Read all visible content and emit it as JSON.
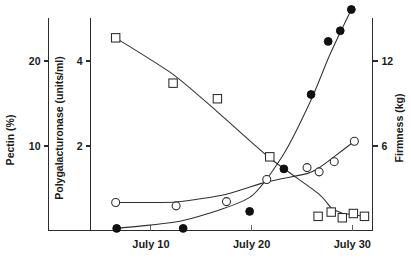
{
  "chart_data": {
    "type": "line",
    "title": "",
    "subtitle": "",
    "xlabel": "",
    "grid": false,
    "legend_position": "none",
    "x_axis": {
      "label": "",
      "tick_labels": [
        "July 10",
        "July 20",
        "July 30"
      ],
      "tick_values": [
        10,
        20,
        30
      ],
      "range": [
        4,
        32
      ]
    },
    "y_axes": [
      {
        "id": "pectin",
        "label": "Pectin (%)",
        "position": "left-outer",
        "tick_labels": [
          "10",
          "20"
        ],
        "tick_values": [
          10,
          20
        ],
        "range": [
          0,
          25
        ]
      },
      {
        "id": "polygalacturonase",
        "label": "Polygalacturonase  (units/ml)",
        "position": "left-inner",
        "tick_labels": [
          "2",
          "4"
        ],
        "tick_values": [
          2,
          4
        ],
        "range": [
          0,
          5
        ]
      },
      {
        "id": "firmness",
        "label": "Firmness (kg)",
        "position": "right",
        "tick_labels": [
          "6",
          "12"
        ],
        "tick_values": [
          6,
          12
        ],
        "range": [
          0,
          15
        ]
      }
    ],
    "series": [
      {
        "name": "Firmness (kg)",
        "marker": "open-square",
        "axis": "firmness",
        "x": [
          6.5,
          12.2,
          16.6,
          21.8,
          26.6,
          27.9,
          29.0,
          30.1,
          31.2
        ],
        "values": [
          13.6,
          10.4,
          9.3,
          5.2,
          1.0,
          1.3,
          0.9,
          1.2,
          1.0
        ]
      },
      {
        "name": "Pectin (%)",
        "marker": "open-circle",
        "axis": "pectin",
        "x": [
          6.5,
          12.5,
          17.5,
          21.5,
          25.5,
          26.7,
          28.2,
          30.2
        ],
        "values": [
          3.3,
          2.9,
          3.4,
          6.0,
          7.4,
          6.9,
          8.1,
          10.5
        ]
      },
      {
        "name": "Polygalacturonase (units/ml)",
        "marker": "filled-circle",
        "axis": "polygalacturonase",
        "x": [
          6.6,
          13.2,
          19.8,
          23.2,
          25.9,
          27.6,
          28.8,
          29.9
        ],
        "values": [
          0.05,
          0.05,
          0.45,
          1.45,
          3.2,
          4.45,
          4.7,
          5.2
        ]
      }
    ]
  }
}
